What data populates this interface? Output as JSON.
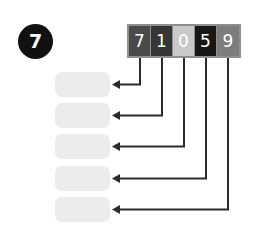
{
  "exercise": {
    "number_badge": "7"
  },
  "digit_strip": {
    "cells": [
      {
        "digit": "7",
        "fill": "#4a4a4a"
      },
      {
        "digit": "1",
        "fill": "#363636"
      },
      {
        "digit": "0",
        "fill": "#c9c9c9"
      },
      {
        "digit": "5",
        "fill": "#171717"
      },
      {
        "digit": "9",
        "fill": "#7d7d7d"
      }
    ],
    "frame_color": "#8f8f8f",
    "digit_color": "#ffffff"
  },
  "answer_boxes": [
    {
      "value": "",
      "fill": "#ececec"
    },
    {
      "value": "",
      "fill": "#ececec"
    },
    {
      "value": "",
      "fill": "#ececec"
    },
    {
      "value": "",
      "fill": "#ececec"
    },
    {
      "value": "",
      "fill": "#ececec"
    }
  ],
  "connectors": {
    "color": "#2b2b2b",
    "links": [
      {
        "from_digit": "7",
        "to_box": 1
      },
      {
        "from_digit": "1",
        "to_box": 2
      },
      {
        "from_digit": "0",
        "to_box": 3
      },
      {
        "from_digit": "5",
        "to_box": 4
      },
      {
        "from_digit": "9",
        "to_box": 5
      }
    ]
  },
  "background_color": "#ffffff"
}
